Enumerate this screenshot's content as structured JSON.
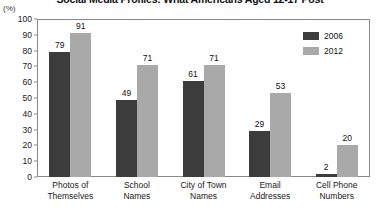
{
  "chart_data": {
    "type": "bar",
    "title": "Social Media Profiles: What Americans Aged 12-17 Post",
    "xlabel": "",
    "ylabel": "(%)",
    "ylim": [
      0,
      100
    ],
    "ytick_step": 10,
    "yticks": [
      "100",
      "90",
      "80",
      "70",
      "60",
      "50",
      "40",
      "30",
      "20",
      "10",
      "0"
    ],
    "grid": false,
    "legend_position": "top-right",
    "categories": [
      "Photos of\nThemselves",
      "School\nNames",
      "City of Town\nNames",
      "Email\nAddresses",
      "Cell Phone\nNumbers"
    ],
    "category_lines": [
      [
        "Photos of",
        "Themselves"
      ],
      [
        "School",
        "Names"
      ],
      [
        "City of Town",
        "Names"
      ],
      [
        "Email",
        "Addresses"
      ],
      [
        "Cell Phone",
        "Numbers"
      ]
    ],
    "series": [
      {
        "name": "2006",
        "color": "#3c3c3c",
        "values": [
          79,
          49,
          61,
          29,
          2
        ]
      },
      {
        "name": "2012",
        "color": "#a9a9a9",
        "values": [
          91,
          71,
          71,
          53,
          20
        ]
      }
    ]
  }
}
